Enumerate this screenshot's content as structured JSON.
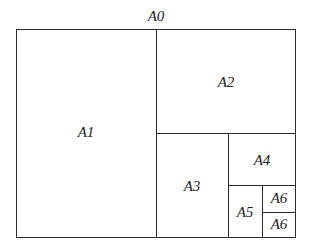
{
  "diagram": {
    "title": "A0",
    "sheets": [
      {
        "label": "A1"
      },
      {
        "label": "A2"
      },
      {
        "label": "A3"
      },
      {
        "label": "A4"
      },
      {
        "label": "A5"
      },
      {
        "label": "A6"
      },
      {
        "label": "A6"
      }
    ]
  },
  "colors": {
    "line": "#2a2a2a",
    "background": "#ffffff"
  }
}
